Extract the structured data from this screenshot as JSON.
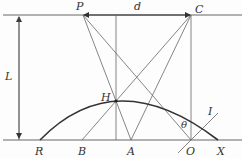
{
  "diagram": {
    "labels": {
      "P": "P",
      "d": "d",
      "C": "C",
      "L": "L",
      "H": "H",
      "theta": "θ",
      "I": "I",
      "R": "R",
      "B": "B",
      "A": "A",
      "O": "O",
      "X": "X"
    },
    "colors": {
      "line": "#555555",
      "arc": "#333333"
    }
  }
}
